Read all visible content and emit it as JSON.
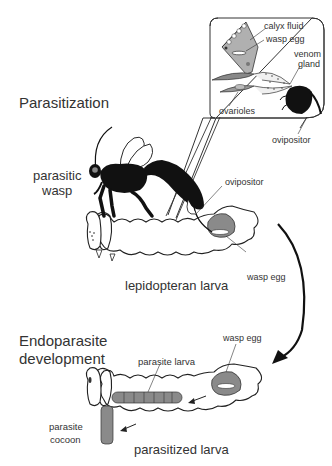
{
  "sections": {
    "parasitization": "Parasitization",
    "endoparasite_line1": "Endoparasite",
    "endoparasite_line2": "development"
  },
  "labels": {
    "parasitic_wasp_line1": "parasitic",
    "parasitic_wasp_line2": "wasp",
    "lepidopteran_larva": "lepidopteran larva",
    "ovipositor_body": "ovipositor",
    "wasp_egg_top": "wasp egg",
    "wasp_egg_bottom": "wasp egg",
    "parasite_larva": "parasite larva",
    "parasite_cocoon_line1": "parasite",
    "parasite_cocoon_line2": "cocoon",
    "parasitized_larva": "parasitized larva"
  },
  "inset": {
    "calyx_fluid": "calyx fluid",
    "wasp_egg": "wasp egg",
    "venom_line1": "venom",
    "venom_line2": "gland",
    "ovarioles": "ovarioles",
    "ovipositor": "ovipositor"
  },
  "colors": {
    "ink": "#111111",
    "text": "#333333",
    "shade": "#8a8a8a",
    "light_shade": "#b8b8b8"
  }
}
